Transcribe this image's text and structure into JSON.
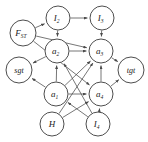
{
  "figure": {
    "type": "directed-graph",
    "title": "",
    "background_color": "#ffffff",
    "node_fill": "#ffffff",
    "node_stroke": "#3a3a3a",
    "edge_color": "#4a4a4a"
  },
  "nodes": [
    {
      "id": "F_ST",
      "base": "F",
      "sub": "ST",
      "x": 23,
      "y": 33,
      "r": 13
    },
    {
      "id": "I2",
      "base": "I",
      "sub": "2",
      "x": 58,
      "y": 18,
      "r": 12
    },
    {
      "id": "I3",
      "base": "I",
      "sub": "3",
      "x": 102,
      "y": 18,
      "r": 12
    },
    {
      "id": "a2",
      "base": "a",
      "sub": "2",
      "x": 57,
      "y": 51,
      "r": 12
    },
    {
      "id": "a3",
      "base": "a",
      "sub": "3",
      "x": 101,
      "y": 51,
      "r": 12
    },
    {
      "id": "sgt",
      "base": "sgt",
      "sub": "",
      "x": 19,
      "y": 70,
      "r": 13
    },
    {
      "id": "tgt",
      "base": "tgt",
      "sub": "",
      "x": 131,
      "y": 70,
      "r": 13
    },
    {
      "id": "a1",
      "base": "a",
      "sub": "1",
      "x": 56,
      "y": 94,
      "r": 12
    },
    {
      "id": "a4",
      "base": "a",
      "sub": "4",
      "x": 101,
      "y": 94,
      "r": 12
    },
    {
      "id": "H",
      "base": "H",
      "sub": "",
      "x": 52,
      "y": 124,
      "r": 12
    },
    {
      "id": "I4",
      "base": "I",
      "sub": "4",
      "x": 98,
      "y": 124,
      "r": 12
    }
  ],
  "edges": [
    {
      "from": "F_ST",
      "to": "I2",
      "arrow": true
    },
    {
      "from": "I2",
      "to": "I3",
      "arrow": true
    },
    {
      "from": "F_ST",
      "to": "a3",
      "arrow": true
    },
    {
      "from": "I2",
      "to": "a2",
      "arrow": true
    },
    {
      "from": "I3",
      "to": "a3",
      "arrow": true
    },
    {
      "from": "a2",
      "to": "a3",
      "arrow": true
    },
    {
      "from": "F_ST",
      "to": "a4",
      "arrow": true
    },
    {
      "from": "a2",
      "to": "sgt",
      "arrow": true
    },
    {
      "from": "a3",
      "to": "tgt",
      "arrow": true
    },
    {
      "from": "a1",
      "to": "a2",
      "arrow": true
    },
    {
      "from": "a1",
      "to": "a3",
      "arrow": true
    },
    {
      "from": "a1",
      "to": "a4",
      "arrow": true
    },
    {
      "from": "a1",
      "to": "sgt",
      "arrow": true
    },
    {
      "from": "a4",
      "to": "a3",
      "arrow": true
    },
    {
      "from": "a4",
      "to": "tgt",
      "arrow": true
    },
    {
      "from": "H",
      "to": "a4",
      "arrow": true
    },
    {
      "from": "H",
      "to": "a3",
      "arrow": true
    },
    {
      "from": "I4",
      "to": "a4",
      "arrow": true
    },
    {
      "from": "I4",
      "to": "a2",
      "arrow": true
    },
    {
      "from": "I4",
      "to": "a1",
      "arrow": true
    }
  ]
}
